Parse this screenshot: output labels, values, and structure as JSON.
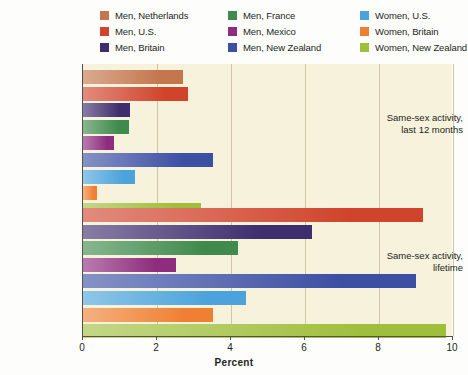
{
  "chart_data": {
    "type": "bar",
    "orientation": "horizontal",
    "title": "",
    "xlabel": "Percent",
    "ylabel": "",
    "xlim": [
      0,
      10
    ],
    "xticks": [
      0,
      2,
      4,
      6,
      8,
      10
    ],
    "xtick_labels": [
      "0",
      "2",
      "4",
      "6",
      "8",
      "10"
    ],
    "grid": true,
    "grid_axis": "x",
    "legend_position": "top",
    "categories": [
      "Same-sex activity, last 12 months",
      "Same-sex activity, lifetime"
    ],
    "category_labels": [
      [
        "Same-sex activity,",
        "last 12 months"
      ],
      [
        "Same-sex activity,",
        "lifetime"
      ]
    ],
    "series": [
      {
        "name": "Men, Netherlands",
        "color": "#c4764c",
        "values": [
          2.7,
          null
        ]
      },
      {
        "name": "Men, U.S.",
        "color": "#d0442c",
        "values": [
          2.85,
          9.2
        ]
      },
      {
        "name": "Men, Britain",
        "color": "#3f2e6e",
        "values": [
          1.27,
          6.2
        ]
      },
      {
        "name": "Men, France",
        "color": "#3f8a4c",
        "values": [
          1.24,
          4.2
        ]
      },
      {
        "name": "Men, Mexico",
        "color": "#8e2c7e",
        "values": [
          0.84,
          2.5
        ]
      },
      {
        "name": "Men, New Zealand",
        "color": "#3b4fa3",
        "values": [
          3.5,
          9.0
        ]
      },
      {
        "name": "Women, U.S.",
        "color": "#4aa3da",
        "values": [
          1.4,
          4.4
        ]
      },
      {
        "name": "Women, Britain",
        "color": "#ef8033",
        "values": [
          0.38,
          3.5
        ]
      },
      {
        "name": "Women, New Zealand",
        "color": "#9fbe3c",
        "values": [
          3.2,
          9.8
        ]
      }
    ]
  },
  "legend": {
    "columns": [
      [
        {
          "label": "Men, Netherlands",
          "color": "#c4764c",
          "swatch": "legend-swatch"
        },
        {
          "label": "Men, U.S.",
          "color": "#d0442c",
          "swatch": "legend-swatch"
        },
        {
          "label": "Men, Britain",
          "color": "#3f2e6e",
          "swatch": "legend-swatch"
        }
      ],
      [
        {
          "label": "Men, France",
          "color": "#3f8a4c",
          "swatch": "legend-swatch"
        },
        {
          "label": "Men, Mexico",
          "color": "#8e2c7e",
          "swatch": "legend-swatch"
        },
        {
          "label": "Men, New Zealand",
          "color": "#3b4fa3",
          "swatch": "legend-swatch"
        }
      ],
      [
        {
          "label": "Women, U.S.",
          "color": "#4aa3da",
          "swatch": "legend-swatch"
        },
        {
          "label": "Women, Britain",
          "color": "#ef8033",
          "swatch": "legend-swatch"
        },
        {
          "label": "Women, New Zealand",
          "color": "#9fbe3c",
          "swatch": "legend-swatch"
        }
      ]
    ],
    "flat": [
      "Men, Netherlands",
      "Men, France",
      "Women, U.S.",
      "Men, U.S.",
      "Men, Mexico",
      "Women, Britain",
      "Men, Britain",
      "Men, New Zealand",
      "Women, New Zealand"
    ]
  },
  "axis": {
    "x_title": "Percent",
    "tick_labels": [
      "0",
      "2",
      "4",
      "6",
      "8",
      "10"
    ]
  },
  "colors": {
    "plot_background": "#f7f2dc",
    "gridline": "#cfc6a8",
    "axis": "#555049",
    "text": "#231f20"
  }
}
